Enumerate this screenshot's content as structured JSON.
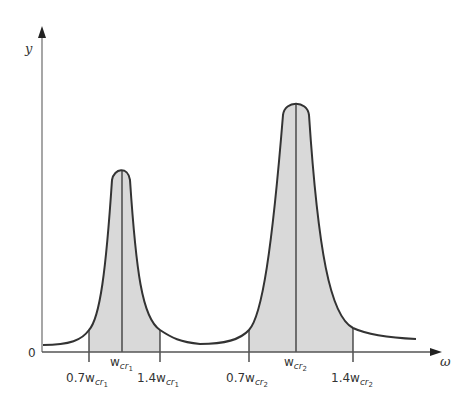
{
  "diagram": {
    "y_axis_label": "y",
    "x_axis_label": "ω",
    "origin_label": "0",
    "colors": {
      "stroke": "#333333",
      "fill": "#d9d9d9",
      "axis": "#777777"
    },
    "peaks": [
      {
        "name": "peak-1",
        "center_label": {
          "base": "w",
          "sub": "cr",
          "subsub": "1"
        },
        "lower_label": {
          "prefix": "0.7",
          "base": "w",
          "sub": "cr",
          "subsub": "1"
        },
        "upper_label": {
          "prefix": "1.4",
          "base": "w",
          "sub": "cr",
          "subsub": "1"
        }
      },
      {
        "name": "peak-2",
        "center_label": {
          "base": "w",
          "sub": "cr",
          "subsub": "2"
        },
        "lower_label": {
          "prefix": "0.7",
          "base": "w",
          "sub": "cr",
          "subsub": "2"
        },
        "upper_label": {
          "prefix": "1.4",
          "base": "w",
          "sub": "cr",
          "subsub": "2"
        }
      }
    ]
  }
}
